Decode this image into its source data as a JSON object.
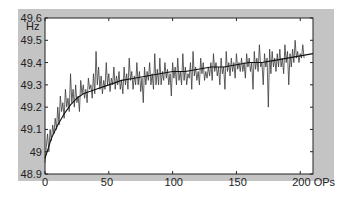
{
  "chart_data": {
    "type": "line",
    "title": "",
    "xlabel": "OPs",
    "ylabel": "Hz",
    "xlim": [
      0,
      210
    ],
    "ylim": [
      48.9,
      49.6
    ],
    "x_ticks": [
      0,
      50,
      100,
      150,
      200
    ],
    "x_tick_labels": [
      "0",
      "50",
      "100",
      "150",
      "200 OPs"
    ],
    "y_ticks": [
      48.9,
      49.0,
      49.1,
      49.2,
      49.3,
      49.4,
      49.5,
      49.6
    ],
    "y_tick_labels": [
      "48.9",
      "49",
      "49.1",
      "49.2",
      "49.3",
      "49.4",
      "49.5",
      "49.6"
    ],
    "y_unit_label": "Hz",
    "grid": false,
    "legend": null,
    "series": [
      {
        "name": "raw frequency",
        "style": "noisy",
        "color": "#3a3a3a",
        "x_step": 1,
        "values": [
          48.95,
          49.02,
          49.08,
          49.0,
          49.1,
          49.05,
          49.12,
          49.08,
          49.15,
          49.1,
          49.2,
          49.12,
          49.25,
          49.18,
          49.22,
          49.15,
          49.28,
          49.2,
          49.24,
          49.18,
          49.35,
          49.22,
          49.28,
          49.2,
          49.3,
          49.22,
          49.25,
          49.18,
          49.32,
          49.26,
          49.3,
          49.24,
          49.28,
          49.22,
          49.33,
          49.28,
          49.3,
          49.24,
          49.35,
          49.26,
          49.45,
          49.3,
          49.38,
          49.28,
          49.34,
          49.26,
          49.32,
          49.28,
          49.4,
          49.3,
          49.35,
          49.27,
          49.33,
          49.3,
          49.38,
          49.28,
          49.34,
          49.3,
          49.36,
          49.28,
          49.32,
          49.26,
          49.38,
          49.3,
          49.35,
          49.28,
          49.42,
          49.32,
          49.36,
          49.28,
          49.34,
          49.3,
          49.4,
          49.3,
          49.36,
          49.27,
          49.33,
          49.22,
          49.38,
          49.3,
          49.36,
          49.32,
          49.4,
          49.3,
          49.35,
          49.28,
          49.44,
          49.3,
          49.37,
          49.3,
          49.42,
          49.3,
          49.36,
          49.32,
          49.4,
          49.33,
          49.37,
          49.3,
          49.35,
          49.25,
          49.4,
          49.33,
          49.38,
          49.3,
          49.42,
          49.32,
          49.36,
          49.3,
          49.44,
          49.32,
          49.38,
          49.3,
          49.35,
          49.33,
          49.4,
          49.28,
          49.45,
          49.34,
          49.38,
          49.32,
          49.36,
          49.3,
          49.42,
          49.35,
          49.4,
          49.32,
          49.36,
          49.33,
          49.38,
          49.34,
          49.4,
          49.32,
          49.44,
          49.36,
          49.4,
          49.34,
          49.38,
          49.3,
          49.42,
          49.35,
          49.38,
          49.28,
          49.45,
          49.36,
          49.4,
          49.34,
          49.42,
          49.36,
          49.4,
          49.33,
          49.44,
          49.37,
          49.4,
          49.36,
          49.42,
          49.36,
          49.4,
          49.33,
          49.44,
          49.38,
          49.42,
          49.36,
          49.4,
          49.28,
          49.45,
          49.37,
          49.42,
          49.36,
          49.48,
          49.38,
          49.4,
          49.3,
          49.44,
          49.38,
          49.42,
          49.2,
          49.46,
          49.35,
          49.45,
          49.38,
          49.42,
          49.36,
          49.44,
          49.38,
          49.46,
          49.38,
          49.42,
          49.35,
          49.48,
          49.4,
          49.45,
          49.3,
          49.44,
          49.38,
          49.46,
          49.4,
          49.5,
          49.42,
          49.45,
          49.4,
          49.44,
          49.42,
          49.48,
          49.42
        ]
      },
      {
        "name": "smoothed trend",
        "style": "smooth",
        "color": "#111111",
        "x": [
          0,
          5,
          10,
          15,
          20,
          25,
          30,
          40,
          50,
          60,
          70,
          80,
          90,
          100,
          110,
          120,
          130,
          140,
          150,
          160,
          170,
          180,
          190,
          200,
          210
        ],
        "values": [
          48.97,
          49.06,
          49.12,
          49.17,
          49.21,
          49.24,
          49.26,
          49.28,
          49.3,
          49.32,
          49.33,
          49.34,
          49.35,
          49.36,
          49.36,
          49.37,
          49.38,
          49.38,
          49.39,
          49.4,
          49.4,
          49.41,
          49.42,
          49.43,
          49.44
        ]
      }
    ]
  }
}
